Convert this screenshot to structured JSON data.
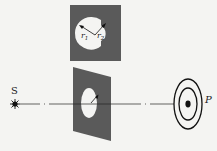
{
  "diagram": {
    "title": "",
    "labels": {
      "source": "S",
      "point": "P",
      "r1": "r",
      "r1_sub": "1",
      "r2": "r",
      "r2_sub": "2"
    },
    "colors": {
      "screen": "#5a5a5a",
      "background": "#f4f4f2",
      "line": "#222222"
    },
    "elements": [
      "point source S",
      "front view of aperture with radii r1, r2",
      "tilted screen with circular aperture",
      "optical axis (dash-dot line)",
      "concentric diffraction rings at P"
    ]
  }
}
